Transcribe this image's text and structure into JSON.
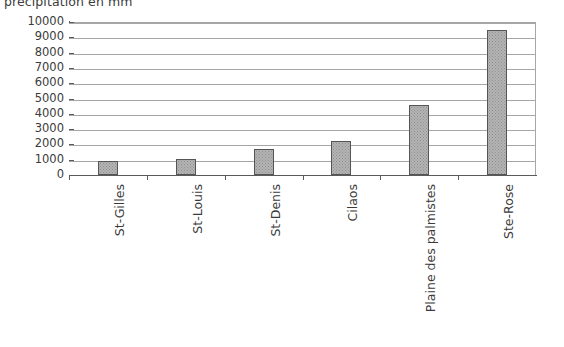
{
  "chart_data": {
    "type": "bar",
    "title": "précipitation en mm",
    "xlabel": "",
    "ylabel": "",
    "ylim": [
      0,
      10000
    ],
    "ytick_step": 1000,
    "grid": true,
    "legend": false,
    "orientation": "vertical",
    "bar_label_rotation": -90,
    "categories": [
      "St-Gilles",
      "St-Louis",
      "St-Denis",
      "Cilaos",
      "Plaine des palmistes",
      "Ste-Rose"
    ],
    "values": [
      900,
      1050,
      1700,
      2250,
      4600,
      9450
    ],
    "ytick_labels": [
      "10000",
      "9000",
      "8000",
      "7000",
      "6000",
      "5000",
      "4000",
      "3000",
      "2000",
      "1000",
      "0"
    ],
    "colors": {
      "bar_fill": "#b4b4b4",
      "bar_pattern": "#8f8f8f",
      "bar_border": "#555555",
      "gridline": "#a6a6a6",
      "axis": "#5a5a5a",
      "text": "#3b3b3b",
      "background": "#ffffff"
    }
  }
}
